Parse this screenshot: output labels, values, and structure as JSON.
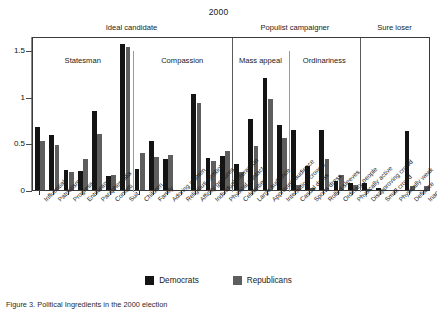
{
  "chart_data": {
    "type": "bar",
    "title": "2000",
    "xlabel": "",
    "ylabel": "",
    "ylim": [
      0,
      1.65
    ],
    "ytick_labels": [
      "0",
      "0.5",
      "1",
      "1.5"
    ],
    "ytick_values": [
      0,
      0.5,
      1,
      1.5
    ],
    "grid": false,
    "legend_position": "bottom-center",
    "orientation": "vertical",
    "categories": [
      "Influentials",
      "Patriotism",
      "Progress",
      "Entourage",
      "Paraphernalia",
      "Confetti",
      "Suit",
      "Children",
      "Family",
      "Adoring women",
      "Religious symbols",
      "Affinity gestures",
      "Individual interaction",
      "Physical contact",
      "Celebrities",
      "Large audience",
      "Approving audience",
      "Interaction crowds",
      "Casual dress",
      "Sports dress",
      "Rolled sleeves",
      "Ordinary people",
      "Physically active",
      "Disapproving crowd",
      "Small crowd",
      "Physically weak",
      "Defiance",
      "Inappropriate"
    ],
    "series": [
      {
        "name": "Democrats",
        "color": "#141414",
        "values": [
          0.67,
          0.59,
          0.21,
          0.2,
          0.85,
          0.15,
          1.56,
          0.23,
          0.52,
          0.33,
          0.0,
          1.03,
          0.34,
          0.36,
          0.28,
          0.76,
          1.2,
          0.7,
          0.64,
          0.26,
          0.64,
          0.1,
          0.07,
          0.07,
          0.02,
          0.0,
          0.63,
          0.0
        ]
      },
      {
        "name": "Republicans",
        "color": "#5e5e5e",
        "values": [
          0.53,
          0.48,
          0.19,
          0.33,
          0.6,
          0.16,
          1.53,
          0.4,
          0.35,
          0.37,
          0.0,
          0.93,
          0.31,
          0.42,
          0.19,
          0.47,
          0.98,
          0.56,
          0.05,
          0.02,
          0.33,
          0.16,
          0.05,
          0.01,
          0.0,
          0.0,
          0.04,
          0.04
        ]
      }
    ],
    "supergroups": [
      {
        "label": "Ideal candidate",
        "start_index": 0,
        "end_index": 13
      },
      {
        "label": "Populist campaigner",
        "start_index": 14,
        "end_index": 22
      },
      {
        "label": "Sure loser",
        "start_index": 23,
        "end_index": 27
      }
    ],
    "panels": [
      {
        "label": "Statesman",
        "start_index": 0,
        "end_index": 6
      },
      {
        "label": "Compassion",
        "start_index": 7,
        "end_index": 13
      },
      {
        "label": "Mass appeal",
        "start_index": 14,
        "end_index": 17
      },
      {
        "label": "Ordinariness",
        "start_index": 18,
        "end_index": 22
      },
      {
        "label": "",
        "start_index": 23,
        "end_index": 27
      }
    ]
  },
  "legend": {
    "items": [
      {
        "label": "Democrats",
        "color": "#141414"
      },
      {
        "label": "Republicans",
        "color": "#5e5e5e"
      }
    ]
  },
  "caption": {
    "text": "Figure 3. Political Ingredients in the 2000 election"
  }
}
